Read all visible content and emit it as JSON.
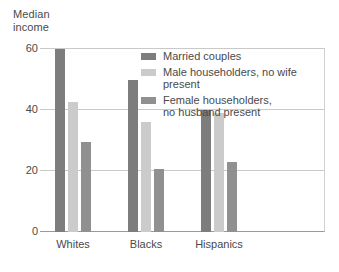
{
  "chart_data": {
    "type": "bar",
    "title": "Median\nincome",
    "xlabel": "",
    "ylabel": "Median income",
    "categories": [
      "Whites",
      "Blacks",
      "Hispanics"
    ],
    "series": [
      {
        "name": "Married couples",
        "color": "#7d7d7d",
        "values": [
          60,
          50,
          40
        ]
      },
      {
        "name": "Male householders, no wife present",
        "color": "#cbcbcb",
        "values": [
          42.5,
          36,
          39
        ]
      },
      {
        "name": "Female householders,\nno husband present",
        "color": "#909090",
        "values": [
          29.5,
          20.5,
          23
        ]
      }
    ],
    "ylim": [
      0,
      60
    ],
    "yticks": [
      0,
      20,
      40,
      60
    ],
    "ytick_labels": [
      "0",
      "20",
      "40",
      "60"
    ],
    "grid": true,
    "legend_position": "top-right"
  },
  "axis": {
    "ytick_0": "0",
    "ytick_20": "20",
    "ytick_40": "40",
    "ytick_60": "60",
    "xcat_0": "Whites",
    "xcat_1": "Blacks",
    "xcat_2": "Hispanics"
  },
  "legend": {
    "item_0": "Married couples",
    "item_1": "Male householders, no wife present",
    "item_2": "Female householders,\nno husband present"
  },
  "colors": {
    "series_1": "#7d7d7d",
    "series_2": "#cbcbcb",
    "series_3": "#909090",
    "gridline": "#c9c9c9",
    "axis": "#9a9a9a",
    "text": "#4a4a4a"
  }
}
